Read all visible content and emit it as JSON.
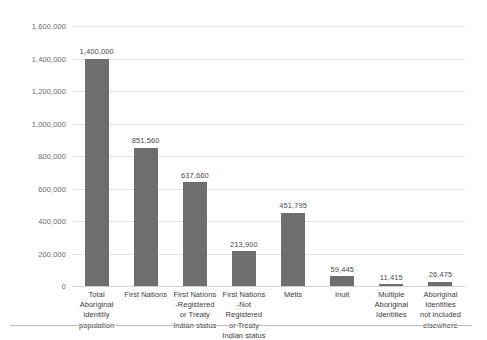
{
  "chart_data": {
    "type": "bar",
    "title": "",
    "subtitle": "",
    "xlabel": "",
    "ylabel": "",
    "ylim": [
      0,
      1600000
    ],
    "ytick_labels": [
      "1,600,000",
      "1,400,000",
      "1,200,000",
      "1,000,000",
      "800,000",
      "600,000",
      "400,000",
      "200,000",
      "0"
    ],
    "ytick_values": [
      1600000,
      1400000,
      1200000,
      1000000,
      800000,
      600000,
      400000,
      200000,
      0
    ],
    "grid": true,
    "legend": "none",
    "bar_color": "#6e6e6e",
    "gridline_color": "#e4e4e4",
    "categories": [
      "Total Aboriginal identitly population",
      "First Nations",
      "First Nations -Registered or Treaty Indian status",
      "First Nations -Not Registered or Treaty Indian status",
      "Métis",
      "Inuit",
      "Multiple Aboriginal Identities",
      "Aboriginal Identities not included elsewhere"
    ],
    "category_lines": [
      [
        "Total",
        "Aboriginal",
        "identitly",
        "population"
      ],
      [
        "First Nations"
      ],
      [
        "First Nations",
        "-Registered",
        "or Treaty",
        "Indian status"
      ],
      [
        "First Nations",
        "-Not Registered",
        "or Treaty",
        "Indian status"
      ],
      [
        "Métis"
      ],
      [
        "Inuit"
      ],
      [
        "Multiple",
        "Aboriginal",
        "Identities"
      ],
      [
        "Aboriginal",
        "Identities",
        "not included",
        "elsewhere"
      ]
    ],
    "values": [
      1400000,
      851560,
      637660,
      213900,
      451795,
      59445,
      11415,
      26475
    ],
    "value_labels": [
      "1,400,000",
      "851,560",
      "637,660",
      "213,900",
      "451,795",
      "59,445",
      "11,415",
      "26,475"
    ]
  }
}
